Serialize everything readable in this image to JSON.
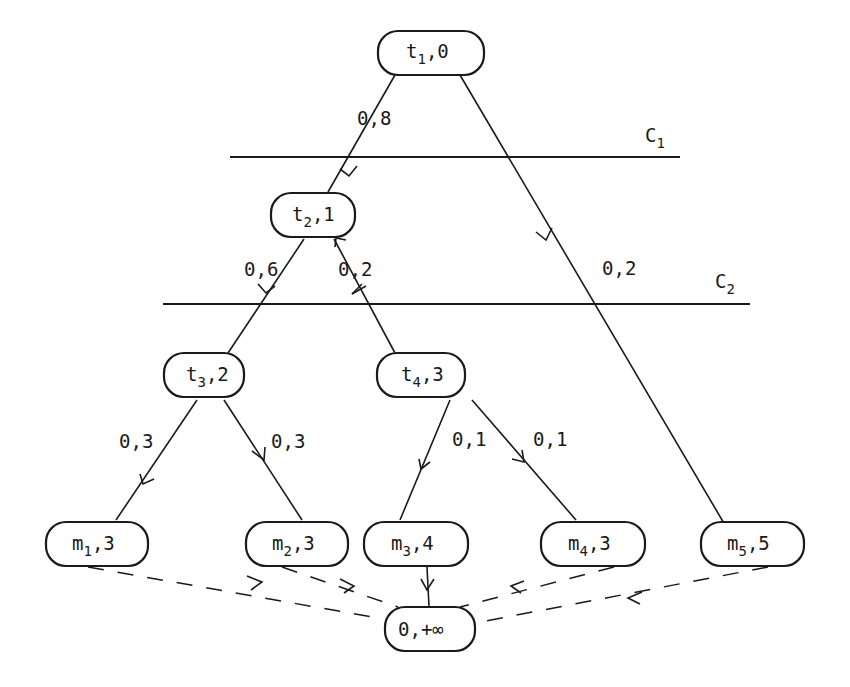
{
  "diagram": {
    "nodes": [
      {
        "id": "t1",
        "name": "t",
        "sub": "1",
        "value": "0",
        "x": 430,
        "y": 52
      },
      {
        "id": "t2",
        "name": "t",
        "sub": "2",
        "value": "1",
        "x": 312,
        "y": 216
      },
      {
        "id": "t3",
        "name": "t",
        "sub": "3",
        "value": "2",
        "x": 202,
        "y": 377
      },
      {
        "id": "t4",
        "name": "t",
        "sub": "4",
        "value": "3",
        "x": 421,
        "y": 377
      },
      {
        "id": "m1",
        "name": "m",
        "sub": "1",
        "value": "3",
        "x": 97,
        "y": 544
      },
      {
        "id": "m2",
        "name": "m",
        "sub": "2",
        "value": "3",
        "x": 298,
        "y": 544
      },
      {
        "id": "m3",
        "name": "m",
        "sub": "3",
        "value": "4",
        "x": 418,
        "y": 544
      },
      {
        "id": "m4",
        "name": "m",
        "sub": "4",
        "value": "3",
        "x": 594,
        "y": 544
      },
      {
        "id": "m5",
        "name": "m",
        "sub": "5",
        "value": "5",
        "x": 751,
        "y": 544
      },
      {
        "id": "sink",
        "name": "0",
        "sub": "",
        "value": "+∞",
        "x": 430,
        "y": 630
      }
    ],
    "edges": [
      {
        "from": "t1",
        "to": "t2",
        "label": "0,8",
        "style": "solid"
      },
      {
        "from": "t1",
        "to": "m5",
        "label": "0,2",
        "style": "solid"
      },
      {
        "from": "t2",
        "to": "t3",
        "label": "0,6",
        "style": "solid"
      },
      {
        "from": "t2",
        "to": "t4",
        "label": "0,2",
        "style": "solid"
      },
      {
        "from": "t3",
        "to": "m1",
        "label": "0,3",
        "style": "solid"
      },
      {
        "from": "t3",
        "to": "m2",
        "label": "0,3",
        "style": "solid"
      },
      {
        "from": "t4",
        "to": "m3",
        "label": "0,1",
        "style": "solid"
      },
      {
        "from": "t4",
        "to": "m4",
        "label": "0,1",
        "style": "solid"
      },
      {
        "from": "m1",
        "to": "sink",
        "label": "",
        "style": "dashed"
      },
      {
        "from": "m2",
        "to": "sink",
        "label": "",
        "style": "dashed"
      },
      {
        "from": "m3",
        "to": "sink",
        "label": "",
        "style": "solid"
      },
      {
        "from": "m4",
        "to": "sink",
        "label": "",
        "style": "dashed"
      },
      {
        "from": "m5",
        "to": "sink",
        "label": "",
        "style": "dashed"
      }
    ],
    "cuts": [
      {
        "name": "C",
        "sub": "1",
        "x1": 230,
        "x2": 680,
        "y": 157
      },
      {
        "name": "C",
        "sub": "2",
        "x1": 163,
        "x2": 750,
        "y": 304
      }
    ],
    "labels": {
      "e_t1_t2": "0,8",
      "e_t1_m5": "0,2",
      "e_t2_t3": "0,6",
      "e_t2_t4": "0,2",
      "e_t3_m1": "0,3",
      "e_t3_m2": "0,3",
      "e_t4_m3": "0,1",
      "e_t4_m4": "0,1"
    },
    "node_text": {
      "t1": {
        "n": "t",
        "s": "1",
        "v": ",0"
      },
      "t2": {
        "n": "t",
        "s": "2",
        "v": ",1"
      },
      "t3": {
        "n": "t",
        "s": "3",
        "v": ",2"
      },
      "t4": {
        "n": "t",
        "s": "4",
        "v": ",3"
      },
      "m1": {
        "n": "m",
        "s": "1",
        "v": ",3"
      },
      "m2": {
        "n": "m",
        "s": "2",
        "v": ",3"
      },
      "m3": {
        "n": "m",
        "s": "3",
        "v": ",4"
      },
      "m4": {
        "n": "m",
        "s": "4",
        "v": ",3"
      },
      "m5": {
        "n": "m",
        "s": "5",
        "v": ",5"
      },
      "sink": {
        "n": "0",
        "s": "",
        "v": ",+∞"
      }
    },
    "cut_text": {
      "c1": {
        "n": "C",
        "s": "1"
      },
      "c2": {
        "n": "C",
        "s": "2"
      }
    }
  }
}
